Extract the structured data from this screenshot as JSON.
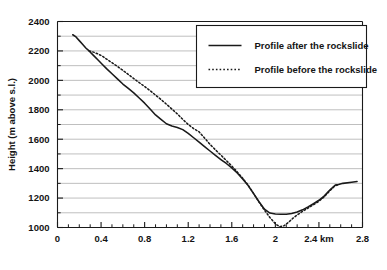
{
  "chart_data": {
    "type": "line",
    "title": "",
    "xlabel": "",
    "ylabel": "Height (m above s.l.)",
    "xlim": [
      0,
      2.8
    ],
    "ylim": [
      1000,
      2400
    ],
    "xticks": [
      0,
      0.4,
      0.8,
      1.2,
      1.6,
      2,
      2.4,
      2.8
    ],
    "xticklabels": [
      "0",
      "0.4",
      "0.8",
      "1.2",
      "1.6",
      "2",
      "2.4 km",
      "2.8"
    ],
    "yticks": [
      1000,
      1200,
      1400,
      1600,
      1800,
      2000,
      2200,
      2400
    ],
    "yticklabels": [
      "1000",
      "1200",
      "1400",
      "1600",
      "1800",
      "2000",
      "2200",
      "2400"
    ],
    "grid": "horizontal-major-and-minor",
    "minor_ytick_step": 100,
    "minor_xtick_step": 0.1,
    "legend_position": "top-right",
    "series": [
      {
        "name": "Profile after the rockslide",
        "style": "solid",
        "color": "#1a1a1a",
        "points": [
          [
            0.14,
            2310
          ],
          [
            0.17,
            2295
          ],
          [
            0.2,
            2270
          ],
          [
            0.23,
            2245
          ],
          [
            0.26,
            2220
          ],
          [
            0.29,
            2200
          ],
          [
            0.33,
            2170
          ],
          [
            0.37,
            2140
          ],
          [
            0.41,
            2110
          ],
          [
            0.45,
            2080
          ],
          [
            0.5,
            2045
          ],
          [
            0.55,
            2010
          ],
          [
            0.6,
            1975
          ],
          [
            0.65,
            1945
          ],
          [
            0.7,
            1915
          ],
          [
            0.75,
            1880
          ],
          [
            0.8,
            1845
          ],
          [
            0.85,
            1805
          ],
          [
            0.9,
            1765
          ],
          [
            0.95,
            1735
          ],
          [
            1.0,
            1705
          ],
          [
            1.05,
            1690
          ],
          [
            1.1,
            1680
          ],
          [
            1.15,
            1665
          ],
          [
            1.2,
            1640
          ],
          [
            1.25,
            1610
          ],
          [
            1.3,
            1580
          ],
          [
            1.35,
            1550
          ],
          [
            1.4,
            1520
          ],
          [
            1.45,
            1490
          ],
          [
            1.5,
            1462
          ],
          [
            1.55,
            1435
          ],
          [
            1.6,
            1405
          ],
          [
            1.65,
            1370
          ],
          [
            1.7,
            1330
          ],
          [
            1.75,
            1285
          ],
          [
            1.8,
            1230
          ],
          [
            1.85,
            1175
          ],
          [
            1.9,
            1125
          ],
          [
            1.95,
            1098
          ],
          [
            2.0,
            1092
          ],
          [
            2.05,
            1090
          ],
          [
            2.1,
            1090
          ],
          [
            2.15,
            1095
          ],
          [
            2.2,
            1105
          ],
          [
            2.25,
            1120
          ],
          [
            2.3,
            1140
          ],
          [
            2.35,
            1162
          ],
          [
            2.4,
            1185
          ],
          [
            2.45,
            1215
          ],
          [
            2.5,
            1255
          ],
          [
            2.55,
            1288
          ],
          [
            2.58,
            1292
          ],
          [
            2.62,
            1300
          ],
          [
            2.7,
            1308
          ],
          [
            2.75,
            1312
          ]
        ]
      },
      {
        "name": "Profile before the rockslide",
        "style": "dotted",
        "color": "#1a1a1a",
        "points": [
          [
            0.29,
            2200
          ],
          [
            0.33,
            2192
          ],
          [
            0.37,
            2180
          ],
          [
            0.41,
            2165
          ],
          [
            0.45,
            2145
          ],
          [
            0.5,
            2120
          ],
          [
            0.55,
            2095
          ],
          [
            0.6,
            2068
          ],
          [
            0.65,
            2040
          ],
          [
            0.7,
            2012
          ],
          [
            0.75,
            1985
          ],
          [
            0.8,
            1958
          ],
          [
            0.85,
            1930
          ],
          [
            0.9,
            1900
          ],
          [
            0.95,
            1870
          ],
          [
            1.0,
            1838
          ],
          [
            1.05,
            1805
          ],
          [
            1.1,
            1772
          ],
          [
            1.15,
            1735
          ],
          [
            1.2,
            1700
          ],
          [
            1.25,
            1672
          ],
          [
            1.3,
            1650
          ],
          [
            1.35,
            1608
          ],
          [
            1.4,
            1565
          ],
          [
            1.45,
            1528
          ],
          [
            1.5,
            1492
          ],
          [
            1.55,
            1455
          ],
          [
            1.6,
            1418
          ],
          [
            1.65,
            1378
          ],
          [
            1.7,
            1335
          ],
          [
            1.75,
            1288
          ],
          [
            1.8,
            1232
          ],
          [
            1.85,
            1172
          ],
          [
            1.9,
            1118
          ],
          [
            1.95,
            1068
          ],
          [
            2.0,
            1025
          ],
          [
            2.04,
            1005
          ],
          [
            2.08,
            1012
          ],
          [
            2.12,
            1035
          ],
          [
            2.16,
            1062
          ],
          [
            2.2,
            1085
          ],
          [
            2.25,
            1110
          ],
          [
            2.3,
            1132
          ],
          [
            2.35,
            1155
          ],
          [
            2.4,
            1178
          ],
          [
            2.45,
            1210
          ],
          [
            2.5,
            1250
          ],
          [
            2.55,
            1285
          ],
          [
            2.58,
            1290
          ]
        ]
      }
    ]
  },
  "legend": {
    "entries": [
      {
        "label": "Profile after the rockslide",
        "style": "solid"
      },
      {
        "label": "Profile before the rockslide",
        "style": "dotted"
      }
    ]
  },
  "colors": {
    "axis": "#1a1a1a",
    "grid": "#b8b8b8",
    "series": "#1a1a1a",
    "background": "#ffffff"
  }
}
